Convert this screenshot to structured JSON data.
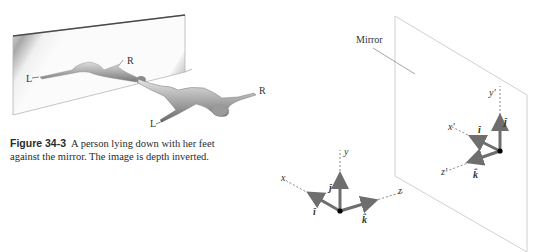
{
  "figure_left": {
    "labels": {
      "mirror_left_hand": "L",
      "mirror_right_hand": "R",
      "person_right_hand": "R",
      "person_left_hand": "L"
    }
  },
  "caption": {
    "label": "Figure 34-3",
    "text": "A person lying down with her feet against the mirror. The image is depth inverted."
  },
  "figure_right": {
    "mirror_label": "Mirror",
    "object_axes": {
      "x": "x",
      "y": "y",
      "z": "z",
      "i": "î",
      "j": "ĵ",
      "k": "k̂"
    },
    "image_axes": {
      "x": "x′",
      "y": "y′",
      "z": "z′",
      "i": "î",
      "j": "ĵ",
      "k": "k̂"
    },
    "colors": {
      "arrow": "#6e6e6e",
      "axis": "#555555",
      "mirror_edge": "#d0d0d0"
    }
  }
}
